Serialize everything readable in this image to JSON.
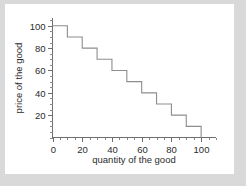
{
  "figure": {
    "background_color": "#d9d9d9",
    "card_color": "#ffffff",
    "line_color": "#8d8d8d",
    "axis_color": "#6e6e6e",
    "text_color": "#2b2b2b"
  },
  "chart_data": {
    "type": "line",
    "title": "",
    "xlabel": "quantity of the good",
    "ylabel": "price of the good",
    "xlim": [
      0,
      110
    ],
    "ylim": [
      0,
      107
    ],
    "grid": false,
    "legend": null,
    "step_style": "post",
    "x_ticks_major": [
      0,
      20,
      40,
      60,
      80,
      100
    ],
    "x_ticks_major_labels": [
      "0",
      "20",
      "40",
      "60",
      "80",
      "100"
    ],
    "x_ticks_minor_step": 5,
    "y_ticks_major": [
      20,
      40,
      60,
      80,
      100
    ],
    "y_ticks_major_labels": [
      "20",
      "40",
      "60",
      "80",
      "100"
    ],
    "y_ticks_minor_step": 5,
    "series": [
      {
        "name": "demand curve",
        "x": [
          0,
          10,
          10,
          20,
          20,
          30,
          30,
          40,
          40,
          50,
          50,
          60,
          60,
          70,
          70,
          80,
          80,
          90,
          90,
          100,
          100
        ],
        "y": [
          100,
          100,
          90,
          90,
          80,
          80,
          70,
          70,
          60,
          60,
          50,
          50,
          40,
          40,
          30,
          30,
          20,
          20,
          10,
          10,
          0
        ]
      }
    ],
    "steps": [
      {
        "x_start": 0,
        "x_end": 10,
        "price": 100
      },
      {
        "x_start": 10,
        "x_end": 20,
        "price": 90
      },
      {
        "x_start": 20,
        "x_end": 30,
        "price": 80
      },
      {
        "x_start": 30,
        "x_end": 40,
        "price": 70
      },
      {
        "x_start": 40,
        "x_end": 50,
        "price": 60
      },
      {
        "x_start": 50,
        "x_end": 60,
        "price": 50
      },
      {
        "x_start": 60,
        "x_end": 70,
        "price": 40
      },
      {
        "x_start": 70,
        "x_end": 80,
        "price": 30
      },
      {
        "x_start": 80,
        "x_end": 90,
        "price": 20
      },
      {
        "x_start": 90,
        "x_end": 100,
        "price": 10
      }
    ]
  }
}
